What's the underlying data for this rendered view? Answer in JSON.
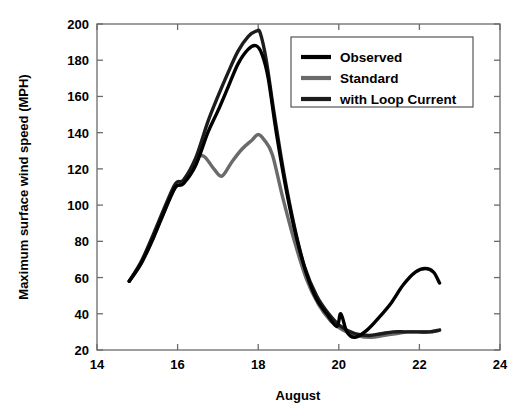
{
  "chart_data": {
    "type": "line",
    "title": "",
    "xlabel": "August",
    "ylabel": "Maximum surface wind speed (MPH)",
    "xlim": [
      14,
      24
    ],
    "ylim": [
      20,
      200
    ],
    "xticks": [
      14,
      16,
      18,
      20,
      22,
      24
    ],
    "yticks": [
      20,
      40,
      60,
      80,
      100,
      120,
      140,
      160,
      180,
      200
    ],
    "grid": false,
    "legend_position": "upper right",
    "series": [
      {
        "name": "Observed",
        "color": "#000000",
        "x": [
          14.8,
          15.1,
          15.4,
          15.7,
          15.95,
          16.15,
          16.45,
          16.75,
          17.0,
          17.25,
          17.5,
          17.75,
          17.95,
          18.1,
          18.25,
          18.45,
          18.7,
          18.95,
          19.2,
          19.45,
          19.7,
          19.95,
          20.05,
          20.2,
          20.4,
          20.7,
          21.0,
          21.3,
          21.6,
          21.9,
          22.15,
          22.35,
          22.5
        ],
        "y": [
          58,
          68,
          82,
          98,
          110,
          112,
          122,
          140,
          152,
          165,
          178,
          186,
          188,
          183,
          170,
          140,
          108,
          82,
          62,
          48,
          40,
          33,
          40,
          30,
          27,
          31,
          38,
          46,
          56,
          63,
          65,
          63,
          57
        ]
      },
      {
        "name": "Standard",
        "color": "#6a6a6a",
        "x": [
          14.8,
          15.1,
          15.4,
          15.7,
          15.95,
          16.15,
          16.45,
          16.65,
          16.9,
          17.1,
          17.35,
          17.6,
          17.85,
          18.0,
          18.15,
          18.35,
          18.6,
          18.9,
          19.2,
          19.5,
          19.8,
          20.1,
          20.45,
          20.8,
          21.1,
          21.4,
          21.7,
          22.0,
          22.25,
          22.5
        ],
        "y": [
          58,
          68,
          82,
          98,
          110,
          112,
          125,
          127,
          120,
          116,
          124,
          131,
          136,
          139,
          136,
          128,
          105,
          80,
          59,
          45,
          36,
          31,
          28,
          27,
          28,
          29,
          30,
          30,
          30,
          31
        ]
      },
      {
        "name": "with Loop Current",
        "color": "#1c1c1c",
        "x": [
          14.8,
          15.1,
          15.4,
          15.7,
          15.95,
          16.15,
          16.45,
          16.75,
          17.0,
          17.25,
          17.5,
          17.75,
          17.95,
          18.05,
          18.2,
          18.4,
          18.65,
          18.9,
          19.15,
          19.45,
          19.75,
          20.05,
          20.4,
          20.75,
          21.05,
          21.35,
          21.65,
          21.95,
          22.25,
          22.5
        ],
        "y": [
          58,
          69,
          84,
          100,
          112,
          114,
          126,
          146,
          160,
          173,
          185,
          193,
          196,
          195,
          180,
          150,
          116,
          88,
          66,
          50,
          40,
          33,
          29,
          28,
          29,
          30,
          30,
          30,
          30,
          31
        ]
      }
    ]
  },
  "legend": {
    "items": [
      {
        "label": "Observed",
        "swatch_color": "#000000"
      },
      {
        "label": "Standard",
        "swatch_color": "#6a6a6a"
      },
      {
        "label": "with Loop Current",
        "swatch_color": "#1c1c1c"
      }
    ]
  },
  "axes": {
    "x_title": "August",
    "y_title": "Maximum surface wind speed (MPH)",
    "x_tick_labels": [
      "14",
      "16",
      "18",
      "20",
      "22",
      "24"
    ],
    "y_tick_labels": [
      "20",
      "40",
      "60",
      "80",
      "100",
      "120",
      "140",
      "160",
      "180",
      "200"
    ]
  },
  "colors": {
    "background": "#ffffff",
    "axis": "#6b6b6b",
    "text": "#000000"
  }
}
